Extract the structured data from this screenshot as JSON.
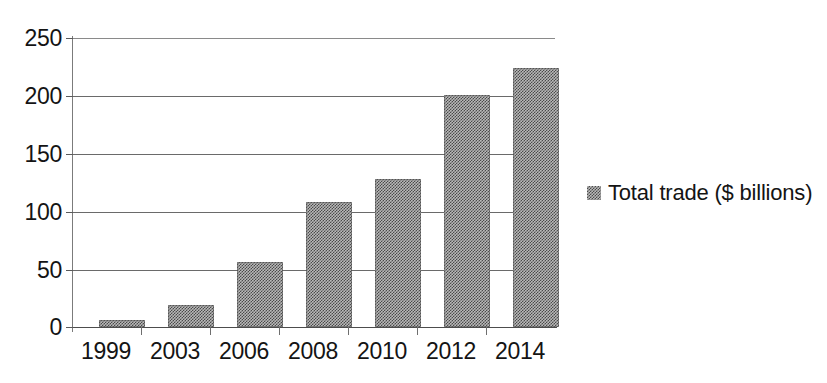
{
  "chart_data": {
    "type": "bar",
    "title": "",
    "subtitle": "",
    "xlabel": "",
    "ylabel": "",
    "categories": [
      "1999",
      "2003",
      "2006",
      "2008",
      "2010",
      "2012",
      "2014"
    ],
    "series": [
      {
        "name": "Total trade ($ billions)",
        "values": [
          6,
          19,
          56,
          108,
          128,
          201,
          224
        ]
      }
    ],
    "ylim": [
      0,
      250
    ],
    "yticks": [
      0,
      50,
      100,
      150,
      200,
      250
    ],
    "ytick_labels": [
      "0",
      "50",
      "100",
      "150",
      "200",
      "250"
    ],
    "grid": true,
    "grid_axis": "y",
    "legend": {
      "position": "right",
      "entries": [
        {
          "label": "Total trade ($ billions)",
          "swatch": "dithered-gray-square",
          "color": "#808080"
        }
      ]
    },
    "colors": {
      "bar_fill": "#808080",
      "axis": "#4d4d4d",
      "gridline": "#6a6a6a",
      "text": "#141414",
      "background": "#ffffff"
    }
  }
}
